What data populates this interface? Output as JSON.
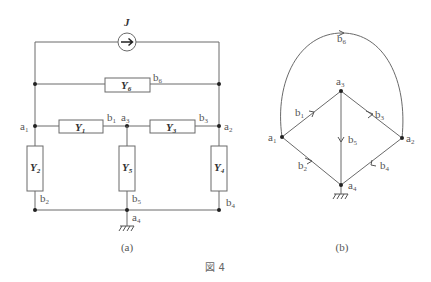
{
  "figure": {
    "caption": "図 4",
    "colors": {
      "wire": "#6a6a6a",
      "node": "#222222",
      "text": "#555555"
    }
  },
  "circuit_a": {
    "caption": "(a)",
    "source": {
      "label": "J",
      "type": "current-source",
      "direction": "right"
    },
    "admittances": [
      {
        "name": "Y",
        "sub": "1",
        "branch": "b",
        "branch_sub": "1"
      },
      {
        "name": "Y",
        "sub": "2",
        "branch": "b",
        "branch_sub": "2"
      },
      {
        "name": "Y",
        "sub": "3",
        "branch": "b",
        "branch_sub": "3"
      },
      {
        "name": "Y",
        "sub": "4",
        "branch": "b",
        "branch_sub": "4"
      },
      {
        "name": "Y",
        "sub": "5",
        "branch": "b",
        "branch_sub": "5"
      },
      {
        "name": "Y",
        "sub": "6",
        "branch": "b",
        "branch_sub": "6"
      }
    ],
    "nodes": [
      {
        "name": "a",
        "sub": "1"
      },
      {
        "name": "a",
        "sub": "2"
      },
      {
        "name": "a",
        "sub": "3"
      },
      {
        "name": "a",
        "sub": "4"
      }
    ],
    "ground": "a4"
  },
  "graph_b": {
    "caption": "(b)",
    "nodes": [
      {
        "name": "a",
        "sub": "1"
      },
      {
        "name": "a",
        "sub": "2"
      },
      {
        "name": "a",
        "sub": "3"
      },
      {
        "name": "a",
        "sub": "4"
      }
    ],
    "edges": [
      {
        "name": "b",
        "sub": "1",
        "from": "a1",
        "to": "a3"
      },
      {
        "name": "b",
        "sub": "2",
        "from": "a1",
        "to": "a4"
      },
      {
        "name": "b",
        "sub": "3",
        "from": "a3",
        "to": "a2"
      },
      {
        "name": "b",
        "sub": "4",
        "from": "a2",
        "to": "a4"
      },
      {
        "name": "b",
        "sub": "5",
        "from": "a3",
        "to": "a4"
      },
      {
        "name": "b",
        "sub": "6",
        "from": "a1",
        "to": "a2"
      }
    ],
    "ground": "a4"
  }
}
